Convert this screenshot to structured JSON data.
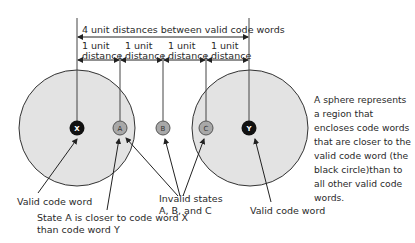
{
  "diagram": {
    "top_label": "4 unit distances between valid code words",
    "unit_labels": [
      {
        "line1": "1 unit",
        "line2": "distance"
      },
      {
        "line1": "1 unit",
        "line2": "distance"
      },
      {
        "line1": "1 unit",
        "line2": "distance"
      },
      {
        "line1": "1 unit",
        "line2": "distance"
      }
    ],
    "nodes": [
      {
        "id": "X",
        "type": "valid"
      },
      {
        "id": "A",
        "type": "invalid"
      },
      {
        "id": "B",
        "type": "invalid"
      },
      {
        "id": "C",
        "type": "invalid"
      },
      {
        "id": "Y",
        "type": "valid"
      }
    ],
    "annotations": {
      "valid_left": "Valid code word",
      "state_a_line1": "State A is closer to code word X",
      "state_a_line2": "than code word Y",
      "invalid_line1": "Invalid states",
      "invalid_line2": "A, B, and C",
      "valid_right": "Valid code word"
    },
    "side_note": "A sphere represents a region that encloses code words that are closer to the valid code word (the black circle)than to all other valid code words.",
    "colors": {
      "sphere_fill": "#e3e3e3",
      "valid_node": "#111111",
      "invalid_node": "#a8a8a8",
      "line": "#222222"
    }
  }
}
